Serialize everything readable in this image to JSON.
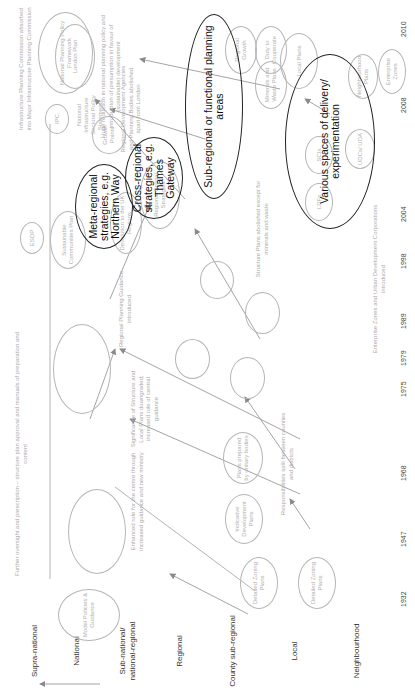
{
  "figure": {
    "orientation": "rotated 90 degrees counter-clockwise",
    "level_labels": [
      "Supra-national",
      "National",
      "Sub-national/ national-regional",
      "Regional",
      "County sub-regional",
      "Local",
      "Neighbourhood"
    ],
    "years": [
      "1932",
      "1947",
      "1968",
      "1975",
      "1979",
      "1989",
      "1998",
      "2004",
      "2008",
      "2010"
    ],
    "nodes": {
      "model_policies": "Model Policies & Guidance",
      "detailed_zoning_county": "Detailed Zoning Plans",
      "detailed_zoning_local": "Detailed Zoning Plans",
      "indicative_dev_plans": "Indicative Development Plans",
      "plans_unitary": "Plans prepared by unitary bodies",
      "esdp": "ESDP",
      "sustainable_communities": "Sustainable Communities Plan",
      "devolution_uk": "Devolution to the UK Regions",
      "regional_spatial": "Regional Spatial Strategies",
      "london_plan": "London Plan",
      "ipc": "IPC",
      "nps": "National Infrastructure Sectoral Policy Statements",
      "nppf": "National Planning Policy Framework",
      "growth_points": "Growth Points",
      "city_regions": "City Regions",
      "duty_cooperate": "Duty to Cooperate",
      "minerals_waste": "Minerals and Waste Plans",
      "local_plans": "Local Plans",
      "ldfs": "LDFs",
      "scis": "SCIs",
      "udcs": "UDCs/ UDA",
      "neighbourhood_plans": "Neighbourhood Plans",
      "enterprise_zones": "Enterprise Zones",
      "regional_growth": "Regional Growth"
    },
    "highlighted_groups": {
      "meta_regional": "Meta-regional strategies, e.g. Northern Way",
      "cross_regional": "Cross-regional strategies, e.g. Thames Gateway",
      "sub_regional": "Sub-regional or functional planning areas",
      "various_spaces": "Various spaces of delivery/ experimentation"
    },
    "annotations": {
      "oversight": "Further oversight and prescription – structure plan approval and manuals of preparation and content",
      "enhanced_role": "Enhanced role for the centre through increased guidance and new ministry",
      "significance": "Significance of Structure and Local Plans downgraded; increased role of central guidance",
      "responsibilities": "Responsibilities split between counties and districts",
      "rpg": "Regional Planning Guidance introduced",
      "enterprise_udc": "Enterprise Zones and Urban Development Corporations introduced",
      "structure_abolished": "Structure Plans abolished except for minerals and waste",
      "rda_abolished": "Regional Development Agencies and Planning Bodies abolished apart from London",
      "huge_reduction": "Huge reduction in national planning policy and introduction of presumption in favour of (sustainable) development",
      "ipc_absorbed": "Infrastructure Planning Commission absorbed into Major Infrastructure Planning Commission"
    }
  }
}
